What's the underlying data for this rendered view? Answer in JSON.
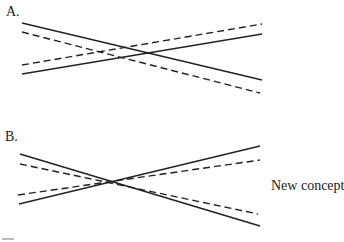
{
  "panels": [
    {
      "label": "A.",
      "lines": [
        {
          "style": "solid",
          "x1": 22,
          "y1": 23,
          "x2": 262,
          "y2": 80
        },
        {
          "style": "dashed",
          "x1": 22,
          "y1": 32,
          "x2": 260,
          "y2": 93
        },
        {
          "style": "solid",
          "x1": 22,
          "y1": 74,
          "x2": 262,
          "y2": 34
        },
        {
          "style": "dashed",
          "x1": 22,
          "y1": 65,
          "x2": 262,
          "y2": 24
        }
      ]
    },
    {
      "label": "B.",
      "side_label": "New concept",
      "lines": [
        {
          "style": "solid",
          "x1": 20,
          "y1": 154,
          "x2": 260,
          "y2": 226
        },
        {
          "style": "dashed",
          "x1": 20,
          "y1": 164,
          "x2": 258,
          "y2": 214
        },
        {
          "style": "solid",
          "x1": 19,
          "y1": 204,
          "x2": 260,
          "y2": 146
        },
        {
          "style": "dashed",
          "x1": 18,
          "y1": 195,
          "x2": 260,
          "y2": 160
        }
      ]
    }
  ],
  "colors": {
    "line": "#222222",
    "background": "#ffffff"
  }
}
